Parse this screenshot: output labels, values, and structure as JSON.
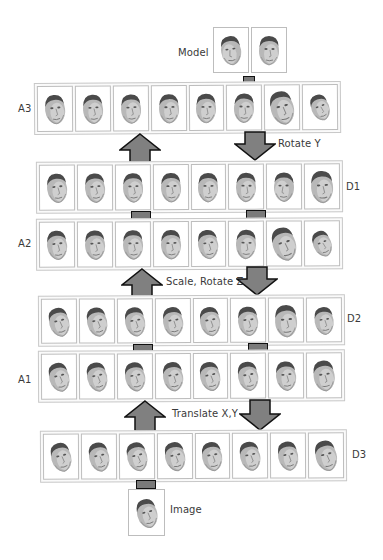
{
  "diagram": {
    "labels": {
      "model": "Model",
      "image": "Image",
      "rows": {
        "A3": "A3",
        "D1": "D1",
        "A2": "A2",
        "D2": "D2",
        "A1": "A1",
        "D3": "D3"
      },
      "transforms": {
        "rotate_y": "Rotate Y",
        "scale_rotate_z": "Scale, Rotate Z",
        "translate_xy": "Translate X,Y"
      }
    },
    "rows_order_top_to_bottom": [
      "A3",
      "D1",
      "A2",
      "D2",
      "A1",
      "D3"
    ],
    "frames_per_row": 8,
    "model_frames": 2,
    "image_frames": 1,
    "arrows": [
      {
        "between": [
          "D1",
          "A3"
        ],
        "direction": "up",
        "side": "left"
      },
      {
        "between": [
          "A3",
          "D1"
        ],
        "direction": "down",
        "side": "right",
        "label": "Rotate Y"
      },
      {
        "between": [
          "D2",
          "A2"
        ],
        "direction": "up",
        "side": "left"
      },
      {
        "between": [
          "A2",
          "D2"
        ],
        "direction": "down",
        "side": "right",
        "label": "Scale, Rotate Z"
      },
      {
        "between": [
          "D3",
          "A1"
        ],
        "direction": "up",
        "side": "left"
      },
      {
        "between": [
          "A1",
          "D3"
        ],
        "direction": "down",
        "side": "right",
        "label": "Translate X,Y"
      }
    ],
    "colors": {
      "arrow_fill": "#808080",
      "arrow_stroke": "#111111",
      "frame_border": "#bdbdbd",
      "row_border": "#c8c8c8",
      "text": "#3a3a3a"
    }
  }
}
